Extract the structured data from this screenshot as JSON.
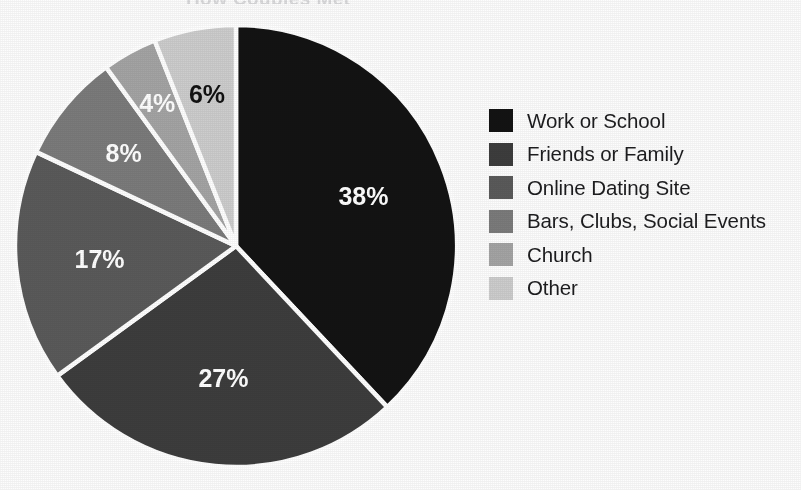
{
  "title_ghost": "How Couples Met",
  "chart_data": {
    "type": "pie",
    "title": "How Couples Met",
    "xlabel": "",
    "ylabel": "",
    "unit": "%",
    "start_angle_deg": 0,
    "direction": "clockwise",
    "legend_position": "right",
    "grid": false,
    "separator_color": "#ffffff",
    "background_color": "#fdfdfd",
    "categories": [
      "Work or School",
      "Friends or Family",
      "Online Dating Site",
      "Bars, Clubs, Social Events",
      "Church",
      "Other"
    ],
    "values": [
      38,
      27,
      17,
      8,
      4,
      6
    ],
    "data_labels": [
      "38%",
      "27%",
      "17%",
      "8%",
      "4%",
      "6%"
    ],
    "colors": [
      "#131313",
      "#3d3d3d",
      "#5a5a5a",
      "#7b7b7b",
      "#a4a4a4",
      "#cdcdcd"
    ],
    "label_text_colors": [
      "#ffffff",
      "#ffffff",
      "#ffffff",
      "#ffffff",
      "#ffffff",
      "#111111"
    ]
  },
  "legend": {
    "items": [
      {
        "label": "Work or School",
        "value": "38%",
        "color": "#131313"
      },
      {
        "label": "Friends or Family",
        "value": "27%",
        "color": "#3d3d3d"
      },
      {
        "label": "Online Dating Site",
        "value": "17%",
        "color": "#5a5a5a"
      },
      {
        "label": "Bars, Clubs, Social Events",
        "value": "8%",
        "color": "#7b7b7b"
      },
      {
        "label": "Church",
        "value": "4%",
        "color": "#a4a4a4"
      },
      {
        "label": "Other",
        "value": "6%",
        "color": "#cdcdcd"
      }
    ]
  }
}
